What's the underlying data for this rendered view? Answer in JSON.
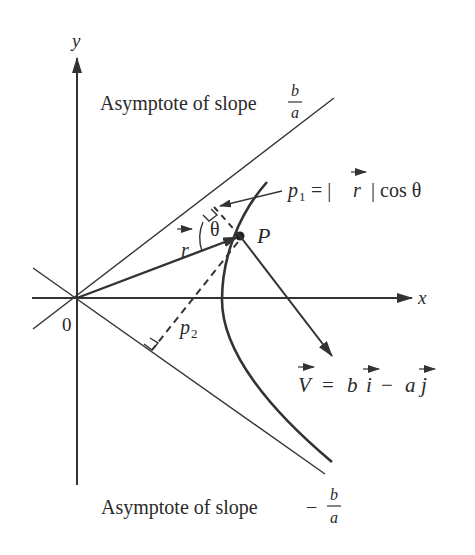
{
  "diagram": {
    "axes": {
      "x_label": "x",
      "y_label": "y",
      "origin_label": "0"
    },
    "asymptotes": {
      "upper": {
        "label_prefix": "Asymptote of slope",
        "sign": "",
        "numerator": "b",
        "denominator": "a"
      },
      "lower": {
        "label_prefix": "Asymptote of slope",
        "sign": "−",
        "numerator": "b",
        "denominator": "a"
      }
    },
    "point": {
      "label": "P"
    },
    "position_vector": {
      "label": "r"
    },
    "angle": {
      "label": "θ"
    },
    "distances": {
      "p1": {
        "sym": "p",
        "sub": "1",
        "equation_rhs": "= |",
        "vec": "r",
        "tail": "| cos θ"
      },
      "p2": {
        "sym": "p",
        "sub": "2"
      }
    },
    "velocity": {
      "lhs": "V",
      "eq": "=",
      "coef_i": "b",
      "vec_i": "i",
      "minus": "−",
      "coef_j": "a",
      "vec_j": "j"
    },
    "colors": {
      "ink": "#333333",
      "background": "#ffffff"
    }
  }
}
